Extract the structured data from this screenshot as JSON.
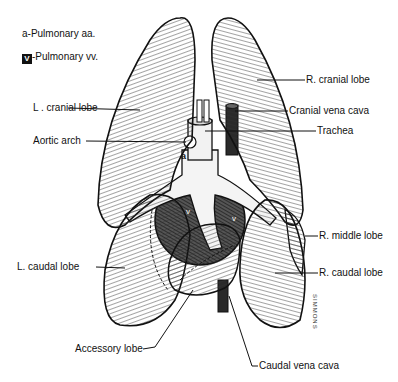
{
  "legend": {
    "arteries": {
      "symbol": "a",
      "text": "-Pulmonary  aa."
    },
    "veins": {
      "symbol": "V",
      "text": "-Pulmonary vv."
    }
  },
  "labels": {
    "r_cranial_lobe": "R. cranial lobe",
    "cranial_vena_cava": "Cranial vena cava",
    "trachea": "Trachea",
    "l_cranial_lobe": "L . cranial lobe",
    "aortic_arch": "Aortic arch",
    "r_middle_lobe": "R. middle lobe",
    "l_caudal_lobe": "L. caudal lobe",
    "r_caudal_lobe": "R. caudal lobe",
    "accessory_lobe": "Accessory lobe",
    "caudal_vena_cava": "Caudal vena cava"
  },
  "inline_marks": {
    "artery": "a",
    "vein": "v"
  },
  "signature": "SIMMONS",
  "colors": {
    "ink": "#111111",
    "paper": "#ffffff",
    "shade": "#3a3a3a"
  }
}
